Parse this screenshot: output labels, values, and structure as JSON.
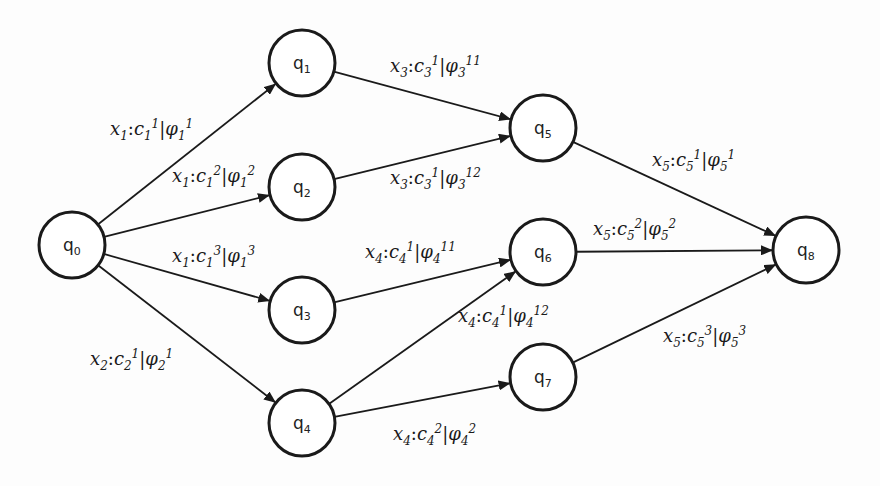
{
  "diagram": {
    "type": "state-transition-graph",
    "background": "#fdfdfd",
    "stroke_color": "#1a1a1a",
    "nodes": [
      {
        "id": "q0",
        "base": "q",
        "sub": "0",
        "cx": 72,
        "cy": 245
      },
      {
        "id": "q1",
        "base": "q",
        "sub": "1",
        "cx": 302,
        "cy": 63
      },
      {
        "id": "q2",
        "base": "q",
        "sub": "2",
        "cx": 302,
        "cy": 187
      },
      {
        "id": "q3",
        "base": "q",
        "sub": "3",
        "cx": 302,
        "cy": 310
      },
      {
        "id": "q4",
        "base": "q",
        "sub": "4",
        "cx": 302,
        "cy": 423
      },
      {
        "id": "q5",
        "base": "q",
        "sub": "5",
        "cx": 543,
        "cy": 128
      },
      {
        "id": "q6",
        "base": "q",
        "sub": "6",
        "cx": 543,
        "cy": 252
      },
      {
        "id": "q7",
        "base": "q",
        "sub": "7",
        "cx": 543,
        "cy": 377
      },
      {
        "id": "q8",
        "base": "q",
        "sub": "8",
        "cx": 806,
        "cy": 250
      }
    ],
    "node_radius": 33,
    "edges": [
      {
        "from": "q0",
        "to": "q1",
        "x": "x",
        "xs": "1",
        "c": "c",
        "cs": "1",
        "cp": "1",
        "phi": "φ",
        "ps": "1",
        "pp": "1",
        "lx": 110,
        "ly": 135
      },
      {
        "from": "q0",
        "to": "q2",
        "x": "x",
        "xs": "1",
        "c": "c",
        "cs": "1",
        "cp": "2",
        "phi": "φ",
        "ps": "1",
        "pp": "2",
        "lx": 172,
        "ly": 182
      },
      {
        "from": "q0",
        "to": "q3",
        "x": "x",
        "xs": "1",
        "c": "c",
        "cs": "1",
        "cp": "3",
        "phi": "φ",
        "ps": "1",
        "pp": "3",
        "lx": 172,
        "ly": 262
      },
      {
        "from": "q0",
        "to": "q4",
        "x": "x",
        "xs": "2",
        "c": "c",
        "cs": "2",
        "cp": "1",
        "phi": "φ",
        "ps": "2",
        "pp": "1",
        "lx": 90,
        "ly": 365
      },
      {
        "from": "q1",
        "to": "q5",
        "x": "x",
        "xs": "3",
        "c": "c",
        "cs": "3",
        "cp": "1",
        "phi": "φ",
        "ps": "3",
        "pp": "11",
        "lx": 390,
        "ly": 72
      },
      {
        "from": "q2",
        "to": "q5",
        "x": "x",
        "xs": "3",
        "c": "c",
        "cs": "3",
        "cp": "1",
        "phi": "φ",
        "ps": "3",
        "pp": "12",
        "lx": 390,
        "ly": 184
      },
      {
        "from": "q3",
        "to": "q6",
        "x": "x",
        "xs": "4",
        "c": "c",
        "cs": "4",
        "cp": "1",
        "phi": "φ",
        "ps": "4",
        "pp": "11",
        "lx": 365,
        "ly": 258
      },
      {
        "from": "q4",
        "to": "q6",
        "x": "x",
        "xs": "4",
        "c": "c",
        "cs": "4",
        "cp": "1",
        "phi": "φ",
        "ps": "4",
        "pp": "12",
        "lx": 458,
        "ly": 322
      },
      {
        "from": "q4",
        "to": "q7",
        "x": "x",
        "xs": "4",
        "c": "c",
        "cs": "4",
        "cp": "2",
        "phi": "φ",
        "ps": "4",
        "pp": "2",
        "lx": 393,
        "ly": 440
      },
      {
        "from": "q5",
        "to": "q8",
        "x": "x",
        "xs": "5",
        "c": "c",
        "cs": "5",
        "cp": "1",
        "phi": "φ",
        "ps": "5",
        "pp": "1",
        "lx": 652,
        "ly": 166
      },
      {
        "from": "q6",
        "to": "q8",
        "x": "x",
        "xs": "5",
        "c": "c",
        "cs": "5",
        "cp": "2",
        "phi": "φ",
        "ps": "5",
        "pp": "2",
        "lx": 593,
        "ly": 235
      },
      {
        "from": "q7",
        "to": "q8",
        "x": "x",
        "xs": "5",
        "c": "c",
        "cs": "5",
        "cp": "3",
        "phi": "φ",
        "ps": "5",
        "pp": "3",
        "lx": 663,
        "ly": 342
      }
    ]
  }
}
